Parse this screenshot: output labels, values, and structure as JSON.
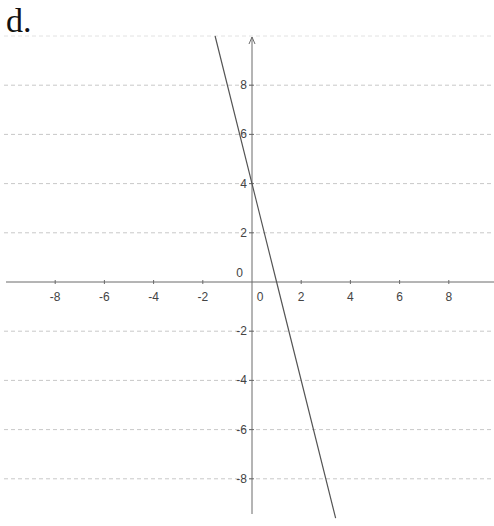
{
  "label": "d.",
  "chart_data": {
    "type": "line",
    "title": "d.",
    "xlabel": "",
    "ylabel": "",
    "xlim": [
      -10.3,
      9.9
    ],
    "ylim": [
      -9.4,
      10
    ],
    "x_ticks": [
      -8,
      -6,
      -4,
      -2,
      0,
      2,
      4,
      6,
      8
    ],
    "y_ticks": [
      -8,
      -6,
      -4,
      -2,
      0,
      2,
      4,
      6,
      8
    ],
    "grid": {
      "horizontal": true,
      "vertical": false,
      "style": "dashed"
    },
    "series": [
      {
        "name": "y = -4x + 4",
        "equation": "y = -4x + 4",
        "x": [
          -1.5,
          0,
          1,
          3.4
        ],
        "y": [
          10,
          4,
          0,
          -9.6
        ],
        "color": "#555555"
      }
    ]
  },
  "colors": {
    "axis": "#6b6b6b",
    "grid": "#c8c8c8",
    "line": "#555555",
    "text": "#444444"
  }
}
